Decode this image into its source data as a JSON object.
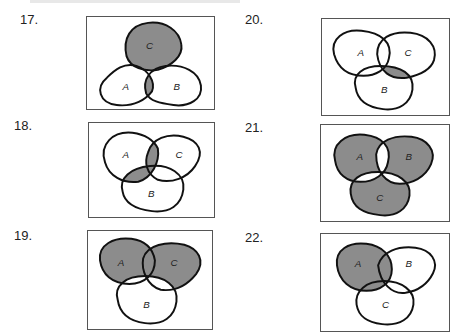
{
  "page": {
    "heading_clipped": true
  },
  "exercises": [
    {
      "number": "17.",
      "labels": {
        "a": "A",
        "b": "B",
        "c": "C"
      },
      "shaded_description": "C plus A∩B"
    },
    {
      "number": "18.",
      "labels": {
        "a": "A",
        "b": "B",
        "c": "C"
      },
      "shaded_description": "(A∩C) ∪ (A∩B)"
    },
    {
      "number": "19.",
      "labels": {
        "a": "A",
        "b": "B",
        "c": "C"
      },
      "shaded_description": "(A ∪ C) − B"
    },
    {
      "number": "20.",
      "labels": {
        "a": "A",
        "b": "B",
        "c": "C"
      },
      "shaded_description": "(B∩C) − A"
    },
    {
      "number": "21.",
      "labels": {
        "a": "A",
        "b": "B",
        "c": "C"
      },
      "shaded_description": "regions in exactly one set"
    },
    {
      "number": "22.",
      "labels": {
        "a": "A",
        "b": "B",
        "c": "C"
      },
      "shaded_description": "A − (B∩C)"
    }
  ],
  "colors": {
    "shade": "#8c8c8c",
    "outline": "#111111",
    "frame": "#555555"
  }
}
